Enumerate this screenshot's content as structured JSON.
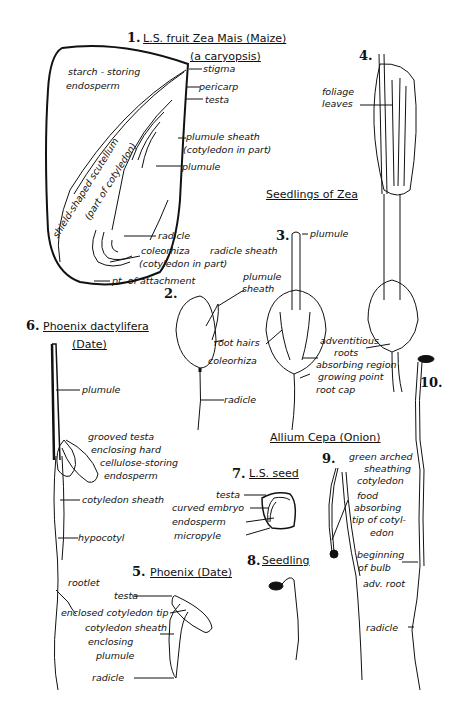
{
  "figures": {
    "fig1": {
      "number": "1.",
      "title_line1": "L.S. fruit Zea Mais (Maize)",
      "title_line2": "(a caryopsis)",
      "labels": {
        "starch1": "starch - storing",
        "starch2": "endosperm",
        "stigma": "stigma",
        "pericarp": "pericarp",
        "testa": "testa",
        "plumule_sheath1": "plumule sheath",
        "plumule_sheath2": "(cotyledon in part)",
        "plumule": "plumule",
        "scutellum1": "shield-shaped scutellum",
        "scutellum2": "(part of cotyledon)",
        "radicle": "radicle",
        "coleorhiza": "coleorhiza",
        "radicle_sheath": "radicle sheath",
        "coleorhiza2": "(cotyledon in part)",
        "attachment": "pt. of attachment"
      }
    },
    "seedlings_title": "Seedlings of Zea",
    "fig2": {
      "number": "2.",
      "labels": {
        "plumule_sheath1": "plumule",
        "plumule_sheath2": "sheath",
        "root_hairs": "root hairs",
        "coleorhiza": "coleorhiza",
        "radicle": "radicle"
      }
    },
    "fig3": {
      "number": "3.",
      "labels": {
        "plumule": "plumule",
        "adventitious": "adventitious",
        "roots": "roots",
        "absorbing": "absorbing region",
        "growing": "growing point",
        "rootcap": "root cap"
      }
    },
    "fig4": {
      "number": "4.",
      "labels": {
        "foliage1": "foliage",
        "foliage2": "leaves"
      }
    },
    "fig6": {
      "number": "6.",
      "title_line1": "Phoenix dactylifera",
      "title_line2": "(Date)",
      "labels": {
        "plumule": "plumule",
        "grooved1": "grooved testa",
        "grooved2": "enclosing hard",
        "grooved3": "cellulose-storing",
        "grooved4": "endosperm",
        "cotyledon_sheath": "cotyledon sheath",
        "hypocotyl": "hypocotyl",
        "rootlet": "rootlet"
      }
    },
    "fig7": {
      "number": "7.",
      "title": "L.S. seed",
      "labels": {
        "testa": "testa",
        "embryo": "curved embryo",
        "endosperm": "endosperm",
        "micropyle": "micropyle"
      }
    },
    "fig8": {
      "number": "8.",
      "title": "Seedling"
    },
    "fig5": {
      "number": "5.",
      "title": "Phoenix (Date)",
      "labels": {
        "testa": "testa",
        "tip": "enclosed cotyledon tip",
        "sheath1": "cotyledon sheath",
        "sheath2": "enclosing",
        "sheath3": "plumule",
        "radicle": "radicle"
      }
    },
    "onion_title": "Allium Cepa (Onion)",
    "fig9": {
      "number": "9.",
      "labels": {
        "green1": "green arched",
        "green2": "sheathing",
        "green3": "cotyledon",
        "food1": "food",
        "food2": "absorbing",
        "food3": "tip of cotyl-",
        "food4": "edon",
        "bulb1": "beginning",
        "bulb2": "of bulb",
        "adv": "adv. root",
        "radicle": "radicle"
      }
    },
    "fig10": {
      "number": "10."
    }
  }
}
